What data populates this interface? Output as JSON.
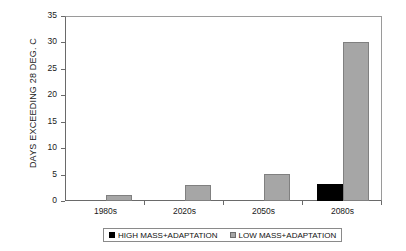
{
  "chart_data": {
    "type": "bar",
    "title": "",
    "xlabel": "",
    "ylabel": "DAYS EXCEEDING 28 DEG. C",
    "ylim": [
      0,
      35
    ],
    "yticks": [
      0,
      5,
      10,
      15,
      20,
      25,
      30,
      35
    ],
    "ytick_labels": [
      "0",
      "5",
      "10",
      "15",
      "20",
      "25",
      "30",
      "35"
    ],
    "grid": false,
    "legend_position": "bottom",
    "categories": [
      "1980s",
      "2020s",
      "2050s",
      "2080s"
    ],
    "series": [
      {
        "name": "HIGH MASS+ADAPTATION",
        "color": "#000000",
        "values": [
          0,
          0,
          0,
          3.3
        ]
      },
      {
        "name": "LOW MASS+ADAPTATION",
        "color": "#a6a6a6",
        "values": [
          1.1,
          3.1,
          5.2,
          30.3
        ]
      }
    ]
  },
  "legend": {
    "entries": [
      {
        "label": "HIGH MASS+ADAPTATION",
        "swatch": "black-square-icon"
      },
      {
        "label": "LOW MASS+ADAPTATION",
        "swatch": "gray-square-icon"
      }
    ]
  }
}
